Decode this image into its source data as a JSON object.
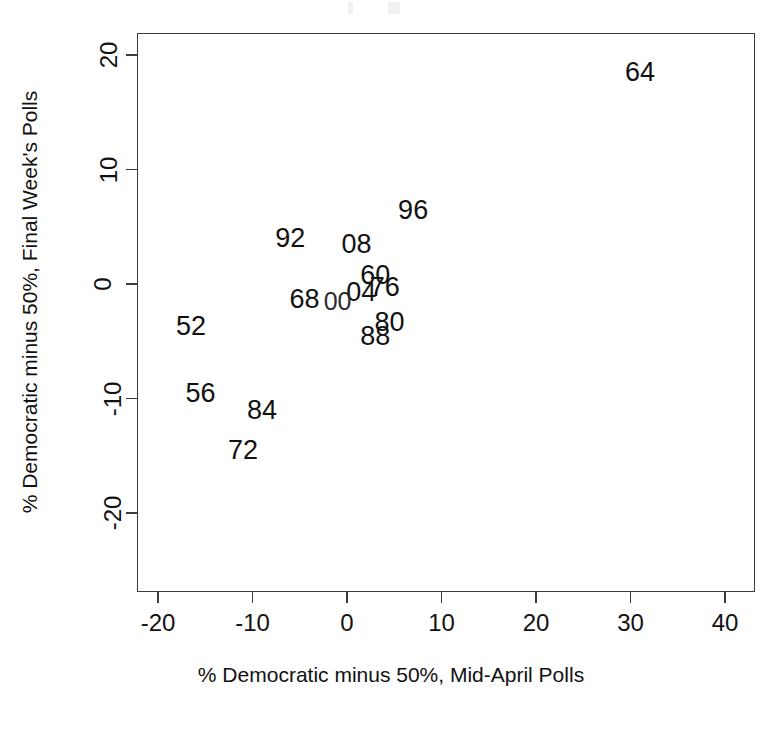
{
  "chart_data": {
    "type": "scatter",
    "title": "",
    "subtitle": "",
    "xlabel": "% Democratic minus 50%, Mid-April Polls",
    "ylabel": "% Democratic minus 50%, Final Week's Polls",
    "xlim": [
      -25,
      44
    ],
    "ylim": [
      -22.5,
      22
    ],
    "xticks": [
      -20,
      -10,
      0,
      10,
      20,
      30,
      40
    ],
    "xtick_labels": [
      "-20",
      "-10",
      "0",
      "10",
      "20",
      "30",
      "40"
    ],
    "yticks": [
      20,
      10,
      0,
      -10,
      -20
    ],
    "ytick_labels": [
      "20",
      "10",
      "0",
      "-10",
      "-20"
    ],
    "grid": false,
    "legend": null,
    "marker_style": "text-label",
    "point_color": "#111111",
    "axis_color": "#3c3c3c",
    "background": "#ffffff",
    "points": [
      {
        "label": "64",
        "x": 31.0,
        "y": 18.5
      },
      {
        "label": "96",
        "x": 7.0,
        "y": 6.5
      },
      {
        "label": "92",
        "x": -6.0,
        "y": 4.0
      },
      {
        "label": "08",
        "x": 1.0,
        "y": 3.5
      },
      {
        "label": "60",
        "x": 3.0,
        "y": 0.8
      },
      {
        "label": "76",
        "x": 4.0,
        "y": -0.3
      },
      {
        "label": "04",
        "x": 1.5,
        "y": -0.7
      },
      {
        "label": "68",
        "x": -4.5,
        "y": -1.3
      },
      {
        "label": "00",
        "x": -1.0,
        "y": -1.5
      },
      {
        "label": "80",
        "x": 4.5,
        "y": -3.3
      },
      {
        "label": "52",
        "x": -16.5,
        "y": -3.7
      },
      {
        "label": "88",
        "x": 3.0,
        "y": -4.5
      },
      {
        "label": "56",
        "x": -15.5,
        "y": -9.5
      },
      {
        "label": "84",
        "x": -9.0,
        "y": -11.0
      },
      {
        "label": "72",
        "x": -11.0,
        "y": -14.5
      }
    ]
  },
  "axes": {
    "x_title": "% Democratic minus 50%, Mid-April Polls",
    "y_title": "% Democratic minus 50%, Final Week's Polls"
  }
}
